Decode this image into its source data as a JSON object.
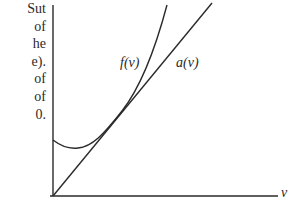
{
  "side_text": {
    "lines": [
      "Sut",
      "of",
      "he",
      "e).",
      "of",
      "of",
      "0."
    ]
  },
  "diagram": {
    "curve_label": "f(v)",
    "line_label": "a(v)",
    "x_axis_label": "v",
    "stroke_color": "#2a2a2a"
  }
}
